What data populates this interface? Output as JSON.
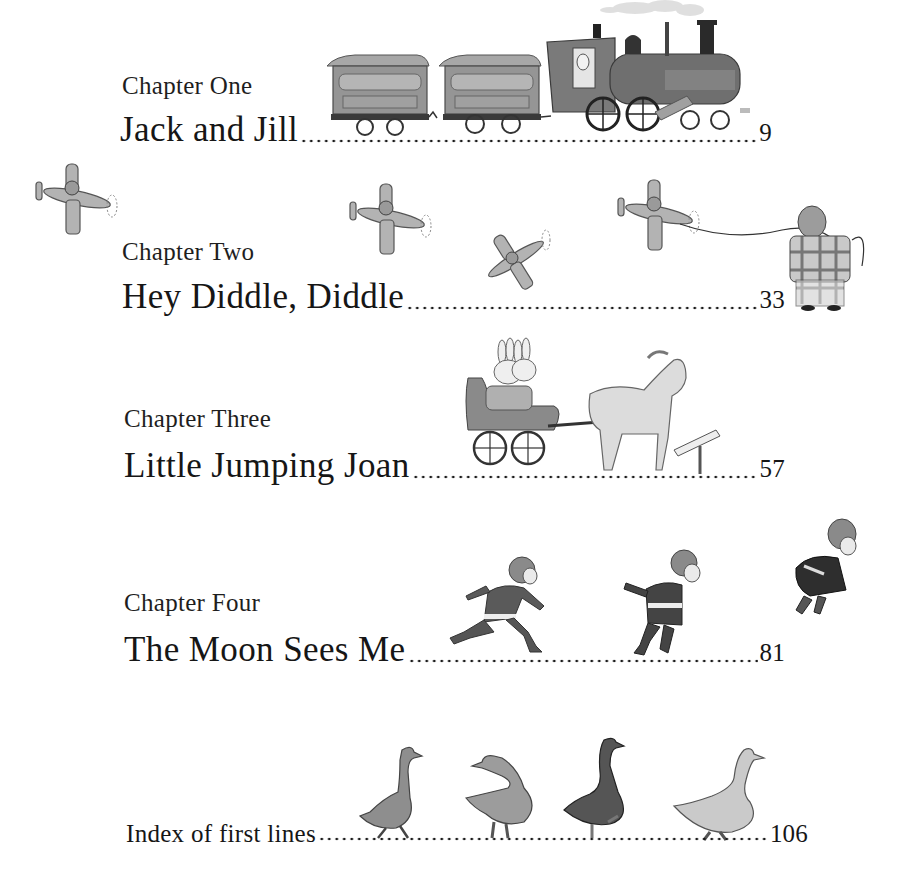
{
  "toc": {
    "entries": [
      {
        "chapter": "Chapter One",
        "title": "Jack and Jill",
        "page": "9"
      },
      {
        "chapter": "Chapter Two",
        "title": "Hey Diddle, Diddle",
        "page": "33"
      },
      {
        "chapter": "Chapter Three",
        "title": "Little Jumping Joan",
        "page": "57"
      },
      {
        "chapter": "Chapter Four",
        "title": "The Moon Sees Me",
        "page": "81"
      }
    ],
    "index": {
      "title": "Index of first lines",
      "page": "106"
    }
  },
  "illustrations": {
    "train": "train-illustration",
    "airplanes": [
      "airplane-illustration",
      "airplane-illustration",
      "airplane-illustration",
      "airplane-illustration"
    ],
    "kite_flyer": "pig-with-string-illustration",
    "carriage": "bunnies-in-horse-carriage-illustration",
    "signpost": "signpost-illustration",
    "runners": [
      "running-boy-illustration",
      "running-boy-illustration",
      "jumping-boy-illustration"
    ],
    "geese": [
      "goose-illustration",
      "goose-illustration",
      "goose-illustration",
      "goose-illustration"
    ]
  },
  "colors": {
    "text": "#1a1a1a",
    "background": "#ffffff",
    "illustration_gray": "#8c8c8c",
    "illustration_dark": "#4a4a4a"
  }
}
